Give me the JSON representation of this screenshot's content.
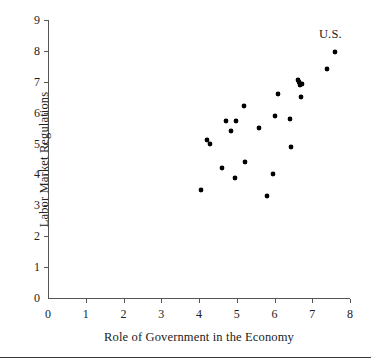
{
  "chart_data": {
    "type": "scatter",
    "title": "",
    "xlabel": "Role of Government in the Economy",
    "ylabel": "Labor Market Regulations",
    "xlim": [
      0,
      8
    ],
    "ylim": [
      0,
      9
    ],
    "xticks": [
      0,
      1,
      2,
      3,
      4,
      5,
      6,
      7,
      8
    ],
    "yticks": [
      0,
      1,
      2,
      3,
      4,
      5,
      6,
      7,
      8,
      9
    ],
    "grid": false,
    "legend": "none",
    "marker": "filled-circle",
    "marker_color": "#000000",
    "points": [
      {
        "x": 4.05,
        "y": 3.5
      },
      {
        "x": 4.2,
        "y": 5.1
      },
      {
        "x": 4.3,
        "y": 5.0
      },
      {
        "x": 4.62,
        "y": 4.2
      },
      {
        "x": 4.72,
        "y": 5.72
      },
      {
        "x": 4.85,
        "y": 5.4
      },
      {
        "x": 4.95,
        "y": 3.9
      },
      {
        "x": 4.97,
        "y": 5.72
      },
      {
        "x": 5.2,
        "y": 6.2
      },
      {
        "x": 5.22,
        "y": 4.4
      },
      {
        "x": 5.6,
        "y": 5.5
      },
      {
        "x": 5.8,
        "y": 3.3
      },
      {
        "x": 5.95,
        "y": 4.0
      },
      {
        "x": 6.0,
        "y": 5.9
      },
      {
        "x": 6.1,
        "y": 6.6
      },
      {
        "x": 6.42,
        "y": 5.8
      },
      {
        "x": 6.45,
        "y": 4.9
      },
      {
        "x": 6.62,
        "y": 7.05
      },
      {
        "x": 6.66,
        "y": 6.98
      },
      {
        "x": 6.68,
        "y": 6.88
      },
      {
        "x": 6.72,
        "y": 6.92
      },
      {
        "x": 6.7,
        "y": 6.5
      },
      {
        "x": 7.4,
        "y": 7.4
      },
      {
        "x": 7.6,
        "y": 7.95
      }
    ],
    "annotations": [
      {
        "label": "U.S.",
        "x": 7.6,
        "y": 8.5
      }
    ]
  }
}
